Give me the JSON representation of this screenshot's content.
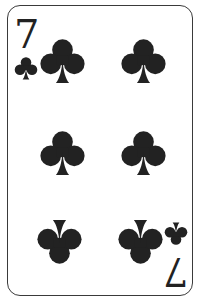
{
  "card": {
    "rank": "7",
    "suit": "clubs",
    "suit_icon": "club-icon",
    "color": "#222222",
    "border_color": "#3a3a3a",
    "background": "#ffffff"
  },
  "corners": {
    "top_left": {
      "rank": "7",
      "suit": "club-icon"
    },
    "bottom_right": {
      "rank": "7",
      "suit": "club-icon",
      "inverted": true
    }
  },
  "pips": [
    {
      "position": "top-left",
      "inverted": false
    },
    {
      "position": "top-right",
      "inverted": false
    },
    {
      "position": "middle-left",
      "inverted": false
    },
    {
      "position": "middle-right",
      "inverted": false
    },
    {
      "position": "bottom-left",
      "inverted": true
    },
    {
      "position": "bottom-right",
      "inverted": true
    }
  ]
}
